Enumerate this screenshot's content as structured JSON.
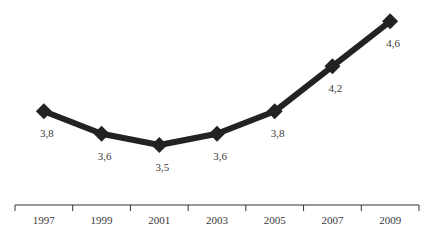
{
  "chart_data": {
    "type": "line",
    "title": "",
    "xlabel": "",
    "ylabel": "",
    "categories": [
      "1997",
      "1999",
      "2001",
      "2003",
      "2005",
      "2007",
      "2009"
    ],
    "series": [
      {
        "name": "",
        "values": [
          3.8,
          3.6,
          3.5,
          3.6,
          3.8,
          4.2,
          4.6
        ],
        "labels": [
          "3,8",
          "3,6",
          "3,5",
          "3,6",
          "3,8",
          "4,2",
          "4,6"
        ],
        "marker": "diamond",
        "color": "#222222"
      }
    ],
    "ylim": [
      3.1,
      4.7
    ],
    "grid": false,
    "legend": "none",
    "y_axis_visible": false
  },
  "colors": {
    "line": "#222222",
    "axis": "#333333",
    "text": "#3a3a3a",
    "background": "#ffffff"
  }
}
